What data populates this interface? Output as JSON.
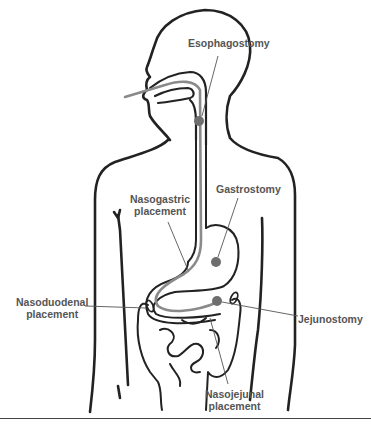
{
  "figure": {
    "type": "anatomical-diagram",
    "colors": {
      "outline": "#222222",
      "tube": "#8a8a8a",
      "marker": "#6e6e6e",
      "leader": "#555555",
      "label_text": "#555555"
    }
  },
  "labels": {
    "esophagostomy": "Esophagostomy",
    "gastrostomy": "Gastrostomy",
    "nasogastric_line1": "Nasogastric",
    "nasogastric_line2": "placement",
    "nasoduodenal_line1": "Nasoduodenal",
    "nasoduodenal_line2": "placement",
    "jejunostomy": "Jejunostomy",
    "nasojejunal_line1": "Nasojejunal",
    "nasojejunal_line2": "placement"
  }
}
